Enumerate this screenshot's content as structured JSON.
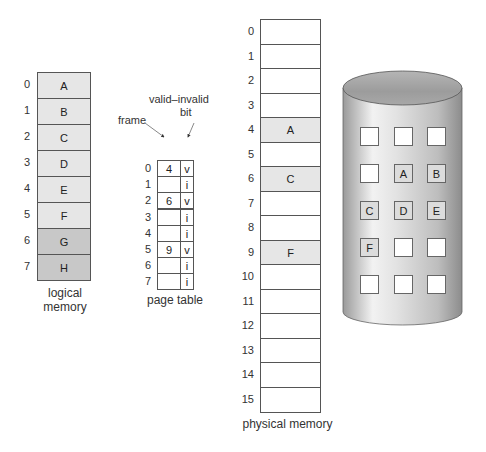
{
  "logical_memory": {
    "title_line1": "logical",
    "title_line2": "memory",
    "pages": [
      {
        "index": "0",
        "label": "A",
        "fill": "#e6e6e6"
      },
      {
        "index": "1",
        "label": "B",
        "fill": "#e6e6e6"
      },
      {
        "index": "2",
        "label": "C",
        "fill": "#e6e6e6"
      },
      {
        "index": "3",
        "label": "D",
        "fill": "#e6e6e6"
      },
      {
        "index": "4",
        "label": "E",
        "fill": "#e6e6e6"
      },
      {
        "index": "5",
        "label": "F",
        "fill": "#e6e6e6"
      },
      {
        "index": "6",
        "label": "G",
        "fill": "#c8c8c8"
      },
      {
        "index": "7",
        "label": "H",
        "fill": "#c8c8c8"
      }
    ]
  },
  "page_table": {
    "title": "page table",
    "frame_label": "frame",
    "bit_label_line1": "valid–invalid",
    "bit_label_line2": "bit",
    "entries": [
      {
        "index": "0",
        "frame": "4",
        "bit": "v"
      },
      {
        "index": "1",
        "frame": "",
        "bit": "i"
      },
      {
        "index": "2",
        "frame": "6",
        "bit": "v"
      },
      {
        "index": "3",
        "frame": "",
        "bit": "i"
      },
      {
        "index": "4",
        "frame": "",
        "bit": "i"
      },
      {
        "index": "5",
        "frame": "9",
        "bit": "v"
      },
      {
        "index": "6",
        "frame": "",
        "bit": "i"
      },
      {
        "index": "7",
        "frame": "",
        "bit": "i"
      }
    ]
  },
  "physical_memory": {
    "title": "physical memory",
    "frames": [
      {
        "index": "0",
        "label": ""
      },
      {
        "index": "1",
        "label": ""
      },
      {
        "index": "2",
        "label": ""
      },
      {
        "index": "3",
        "label": ""
      },
      {
        "index": "4",
        "label": "A"
      },
      {
        "index": "5",
        "label": ""
      },
      {
        "index": "6",
        "label": "C"
      },
      {
        "index": "7",
        "label": ""
      },
      {
        "index": "8",
        "label": ""
      },
      {
        "index": "9",
        "label": "F"
      },
      {
        "index": "10",
        "label": ""
      },
      {
        "index": "11",
        "label": ""
      },
      {
        "index": "12",
        "label": ""
      },
      {
        "index": "13",
        "label": ""
      },
      {
        "index": "14",
        "label": ""
      },
      {
        "index": "15",
        "label": ""
      }
    ]
  },
  "backing_store": {
    "slots": [
      [
        "",
        "",
        ""
      ],
      [
        "",
        "A",
        "B"
      ],
      [
        "C",
        "D",
        "E"
      ],
      [
        "F",
        "",
        ""
      ],
      [
        "",
        "",
        ""
      ]
    ]
  },
  "colors": {
    "filled_cell": "#e6e6e6",
    "dark_cell": "#c8c8c8",
    "border": "#555555"
  }
}
